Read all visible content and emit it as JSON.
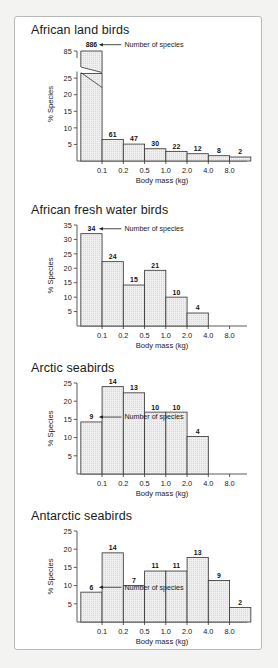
{
  "figure": {
    "shared_xlabel": "Body mass (kg)",
    "shared_ylabel": "% Species",
    "annotation_label": "Number of species",
    "x_tick_labels": [
      "0.1",
      "0.2",
      "0.5",
      "1.0",
      "2.0",
      "4.0",
      "8.0"
    ],
    "bar_fill_color": "#e8e8e8",
    "bar_edge_color": "#3a3a3a",
    "axis_color": "#4a4a4a",
    "background_color": "#ffffff"
  },
  "chart_data": [
    {
      "type": "bar",
      "title": "African land birds",
      "xlabel": "Body mass (kg)",
      "ylabel": "% Species",
      "categories": [
        "0.05",
        "0.14",
        "0.32",
        "0.7",
        "1.4",
        "2.8",
        "5.6",
        "11"
      ],
      "x_tick_labels": [
        "0.1",
        "0.2",
        "0.5",
        "1.0",
        "2.0",
        "4.0",
        "8.0"
      ],
      "values": [
        82.0,
        6.5,
        5.1,
        3.7,
        2.9,
        2.2,
        1.6,
        1.2
      ],
      "data_labels": [
        "886",
        "61",
        "47",
        "30",
        "22",
        "12",
        "8",
        "2"
      ],
      "y_tick_labels": [
        "5",
        "10",
        "15",
        "20",
        "25",
        "85"
      ],
      "ylim": [
        0,
        85
      ],
      "broken_axis": true,
      "break_note": "y-axis broken between 25 and 85",
      "annotation": "Number of species",
      "grid": false,
      "legend": "none"
    },
    {
      "type": "bar",
      "title": "African fresh water birds",
      "xlabel": "Body mass (kg)",
      "ylabel": "% Species",
      "categories": [
        "0.05",
        "0.14",
        "0.32",
        "0.7",
        "1.4",
        "2.8"
      ],
      "x_tick_labels": [
        "0.1",
        "0.2",
        "0.5",
        "1.0",
        "2.0",
        "4.0",
        "8.0"
      ],
      "values": [
        32.0,
        22.3,
        14.2,
        19.3,
        10.0,
        4.5
      ],
      "data_labels": [
        "34",
        "24",
        "15",
        "21",
        "10",
        "4"
      ],
      "y_tick_labels": [
        "5",
        "10",
        "15",
        "20",
        "25",
        "30",
        "35"
      ],
      "ylim": [
        0,
        35
      ],
      "broken_axis": false,
      "annotation": "Number of species",
      "grid": false,
      "legend": "none"
    },
    {
      "type": "bar",
      "title": "Arctic seabirds",
      "xlabel": "Body mass (kg)",
      "ylabel": "% Species",
      "categories": [
        "0.05",
        "0.14",
        "0.32",
        "0.7",
        "1.4",
        "2.8"
      ],
      "x_tick_labels": [
        "0.1",
        "0.2",
        "0.5",
        "1.0",
        "2.0",
        "4.0",
        "8.0"
      ],
      "values": [
        14.3,
        24.0,
        22.3,
        17.0,
        17.0,
        10.3
      ],
      "data_labels": [
        "9",
        "14",
        "13",
        "10",
        "10",
        "4"
      ],
      "y_tick_labels": [
        "5",
        "10",
        "15",
        "20",
        "25"
      ],
      "ylim": [
        0,
        25
      ],
      "broken_axis": false,
      "annotation": "Number of species",
      "grid": false,
      "legend": "none"
    },
    {
      "type": "bar",
      "title": "Antarctic seabirds",
      "xlabel": "Body mass (kg)",
      "ylabel": "% Species",
      "categories": [
        "0.05",
        "0.14",
        "0.32",
        "0.7",
        "1.4",
        "2.8",
        "5.6",
        "11"
      ],
      "x_tick_labels": [
        "0.1",
        "0.2",
        "0.5",
        "1.0",
        "2.0",
        "4.0",
        "8.0"
      ],
      "values": [
        8.2,
        19.0,
        10.0,
        14.0,
        14.0,
        17.7,
        11.4,
        4.0
      ],
      "data_labels": [
        "6",
        "14",
        "7",
        "11",
        "11",
        "13",
        "9",
        "2"
      ],
      "y_tick_labels": [
        "5",
        "10",
        "15",
        "20",
        "25"
      ],
      "ylim": [
        0,
        25
      ],
      "broken_axis": false,
      "annotation": "Number of species",
      "grid": false,
      "legend": "none"
    }
  ]
}
